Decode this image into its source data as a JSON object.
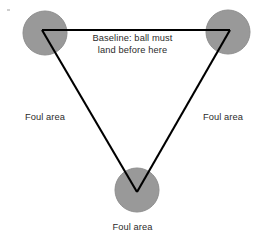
{
  "diagram": {
    "canvas": {
      "width": 265,
      "height": 238,
      "background": "#ffffff"
    },
    "colors": {
      "circle_fill": "#999999",
      "circle_stroke": "#8e8e8e",
      "line": "#000000",
      "text": "#2b2b2b",
      "background": "#ffffff"
    },
    "shapes": {
      "circles": [
        {
          "name": "top-left-player-circle",
          "cx": 45,
          "cy": 33,
          "r": 22
        },
        {
          "name": "top-right-player-circle",
          "cx": 228,
          "cy": 32,
          "r": 22
        },
        {
          "name": "bottom-player-circle",
          "cx": 137,
          "cy": 190,
          "r": 22
        }
      ],
      "triangle": {
        "name": "court-triangle",
        "stroke_width": 2.1,
        "points": [
          {
            "x": 42,
            "y": 30
          },
          {
            "x": 230,
            "y": 30
          },
          {
            "x": 137,
            "y": 192
          }
        ]
      }
    },
    "labels": {
      "baseline": "Baseline: ball must\nland before here",
      "foul_area_left": "Foul area",
      "foul_area_right": "Foul area",
      "foul_area_bottom": "Foul area"
    }
  }
}
